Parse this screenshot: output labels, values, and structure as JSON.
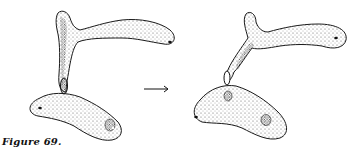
{
  "figure": {
    "caption": "Figure 69.",
    "arrow_symbol": "→",
    "panels": [
      {
        "name": "before",
        "description": "two cells joined by a conjugation tube, upper cell with branched process"
      },
      {
        "name": "after",
        "description": "cells after transfer through conjugation tube"
      }
    ],
    "colors": {
      "ink": "#1a1a1a",
      "stipple": "#555555",
      "background": "#ffffff"
    }
  }
}
